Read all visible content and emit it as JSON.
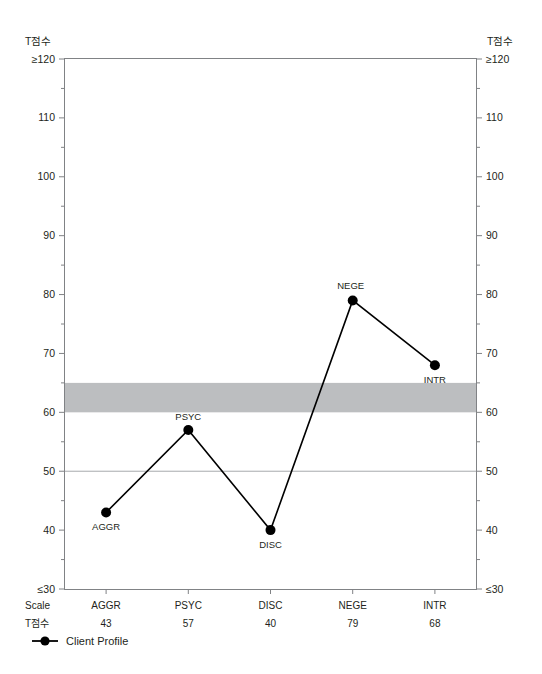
{
  "chart_data": {
    "type": "line",
    "title": "",
    "ylabel": "T점수",
    "ylabel_right": "T점수",
    "xlabel": "",
    "ylim": [
      30,
      120
    ],
    "ytick_labels": [
      "≥120",
      "110",
      "100",
      "90",
      "80",
      "70",
      "60",
      "50",
      "40",
      "≤30"
    ],
    "ytick_values": [
      120,
      110,
      100,
      90,
      80,
      70,
      60,
      50,
      40,
      30
    ],
    "yminor_values": [
      115,
      105,
      95,
      85,
      75,
      65,
      55,
      45,
      35
    ],
    "grid": "horizontal-reference-line-at-50",
    "reference_line": 50,
    "shaded_band": {
      "from": 60,
      "to": 65,
      "color": "#bcbec0"
    },
    "categories": [
      "AGGR",
      "PSYC",
      "DISC",
      "NEGE",
      "INTR"
    ],
    "values": [
      43,
      57,
      40,
      79,
      68
    ],
    "point_label_positions": [
      "below",
      "above",
      "below",
      "above-left",
      "below"
    ],
    "series": [
      {
        "name": "Client Profile",
        "values": [
          43,
          57,
          40,
          79,
          68
        ],
        "marker": "filled-circle",
        "color": "#000000"
      }
    ],
    "legend": {
      "position": "bottom-left",
      "entries": [
        {
          "label": "Client Profile",
          "marker": "filled-circle",
          "color": "#000000"
        }
      ]
    },
    "row_headers": [
      "Scale",
      "T점수"
    ],
    "table": {
      "columns": [
        "AGGR",
        "PSYC",
        "DISC",
        "NEGE",
        "INTR"
      ],
      "rows": [
        {
          "header": "Scale",
          "cells": [
            "AGGR",
            "PSYC",
            "DISC",
            "NEGE",
            "INTR"
          ]
        },
        {
          "header": "T점수",
          "cells": [
            "43",
            "57",
            "40",
            "79",
            "68"
          ]
        }
      ]
    },
    "axis_end_labels": {
      "bottom_left": "≤30",
      "bottom_right": "≤30",
      "top_left": "≥120",
      "top_right": "≥120"
    },
    "colors": {
      "axis": "#808285",
      "plot_border": "#808285",
      "line": "#000000",
      "marker": "#000000",
      "band": "#bcbec0",
      "reference_line": "#a7a9ac",
      "text": "#231f20",
      "background": "#ffffff"
    }
  }
}
